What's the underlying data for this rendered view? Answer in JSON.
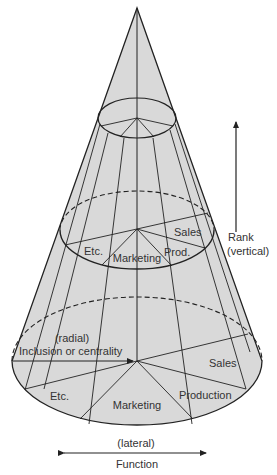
{
  "diagram": {
    "type": "organizational-cone",
    "colors": {
      "cone_fill": "#d9d9d9",
      "line": "#222222",
      "text": "#333333",
      "background": "#ffffff"
    },
    "levels": {
      "top": {
        "segments": []
      },
      "middle": {
        "segments": [
          "Etc.",
          "Marketing",
          "Prod.",
          "Sales"
        ]
      },
      "base": {
        "segments": [
          "Etc.",
          "Marketing",
          "Production",
          "Sales"
        ]
      }
    },
    "axes": {
      "vertical": {
        "line1": "Rank",
        "line2": "(vertical)"
      },
      "radial": {
        "line1": "(radial)",
        "line2": "Inclusion or centrality"
      },
      "lateral": {
        "line1": "(lateral)",
        "line2": "Function"
      }
    }
  }
}
